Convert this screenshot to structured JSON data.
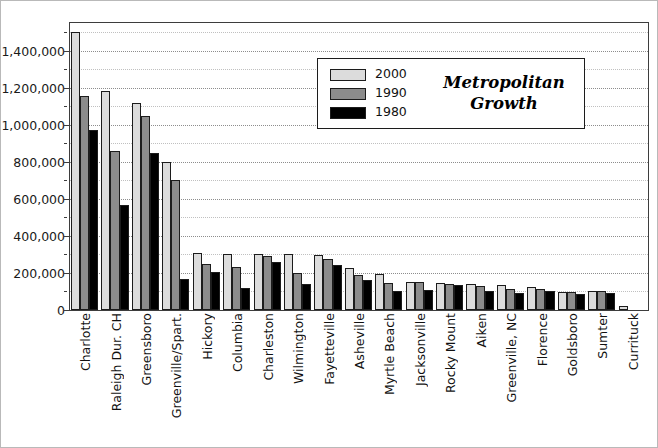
{
  "chart_data": {
    "type": "bar",
    "title": "Metropolitan Growth",
    "xlabel": "",
    "ylabel": "",
    "ylim": [
      0,
      1550000
    ],
    "y_ticks": [
      "0",
      "200,000",
      "400,000",
      "600,000",
      "800,000",
      "1,000,000",
      "1,200,000",
      "1,400,000"
    ],
    "y_tick_values": [
      0,
      200000,
      400000,
      600000,
      800000,
      1000000,
      1200000,
      1400000
    ],
    "y_minor_step": 100000,
    "grid": true,
    "legend_position": "upper-center",
    "categories": [
      "Charlotte",
      "Raleigh Dur. CH",
      "Greensboro",
      "Greenville/Spart.",
      "Hickory",
      "Columbia",
      "Charleston",
      "Wilmington",
      "Fayetteville",
      "Asheville",
      "Myrtle Beach",
      "Jacksonville",
      "Rocky Mount",
      "Aiken",
      "Greenville, NC",
      "Florence",
      "Goldsboro",
      "Sumter",
      "Currituck"
    ],
    "series": [
      {
        "name": "2000",
        "color": "#dcdcdc",
        "values": [
          1500000,
          1185000,
          1120000,
          800000,
          310000,
          300000,
          305000,
          300000,
          295000,
          225000,
          195000,
          150000,
          145000,
          140000,
          135000,
          125000,
          95000,
          100000,
          20000
        ]
      },
      {
        "name": "1990",
        "color": "#8c8c8c",
        "values": [
          1155000,
          860000,
          1050000,
          700000,
          250000,
          230000,
          290000,
          200000,
          275000,
          190000,
          145000,
          150000,
          140000,
          130000,
          115000,
          115000,
          95000,
          100000,
          0
        ]
      },
      {
        "name": "1980",
        "color": "#000000",
        "values": [
          970000,
          565000,
          850000,
          165000,
          205000,
          120000,
          260000,
          140000,
          245000,
          160000,
          100000,
          110000,
          135000,
          105000,
          90000,
          105000,
          85000,
          90000,
          0
        ]
      }
    ]
  },
  "legend": {
    "title_line1": "Metropolitan",
    "title_line2": "Growth",
    "entries": [
      {
        "label": "2000"
      },
      {
        "label": "1990"
      },
      {
        "label": "1980"
      }
    ]
  },
  "colors": {
    "series_2000": "#dcdcdc",
    "series_1990": "#8c8c8c",
    "series_1980": "#000000",
    "frame": "#3d3d3d",
    "gridline": "#8d8d8d",
    "text": "#111111"
  }
}
